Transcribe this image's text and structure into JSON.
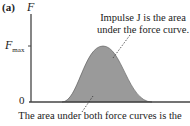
{
  "panel_label": "(a)",
  "axes": {
    "y_label": "F",
    "y_tick_max_main": "F",
    "y_tick_max_sub": "max",
    "y_tick_zero": "0"
  },
  "annotations": {
    "top_line1": "Impulse J is the area",
    "top_line2": "under the force curve.",
    "bottom": "The area under both force curves is the"
  },
  "colors": {
    "curve_fill": "#9a9a9a",
    "axis": "#444444"
  }
}
